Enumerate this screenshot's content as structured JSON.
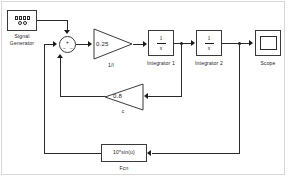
{
  "diagram": {
    "background": "#ffffff",
    "line_color": "#2b2b2b",
    "border_color": "#d8d8d8"
  },
  "blocks": {
    "signal_generator": {
      "label_line1": "Signal",
      "label_line2": "Generator",
      "icon": "signal-generator-icon"
    },
    "sum": {
      "sign_top": "+",
      "sign_left": "−",
      "sign_bottom": "−",
      "icon": "sum-circle-icon"
    },
    "gain_forward": {
      "value": "0.25",
      "label": "1/I"
    },
    "integrator_1": {
      "numerator": "1",
      "denominator": "s",
      "label": "Integrator 1"
    },
    "integrator_2": {
      "numerator": "1",
      "denominator": "s",
      "label": "Integrator 2"
    },
    "scope": {
      "label": "Scope",
      "icon": "scope-screen-icon"
    },
    "gain_feedback": {
      "value": "0.8",
      "label": "c"
    },
    "fcn": {
      "expression": "10*sin(u)",
      "label": "Fcn"
    }
  },
  "signals": [
    {
      "name": "siggen-to-sum",
      "from": "signal_generator",
      "to": "sum"
    },
    {
      "name": "sum-to-gain",
      "from": "sum",
      "to": "gain_forward"
    },
    {
      "name": "gain-to-integrator1",
      "from": "gain_forward",
      "to": "integrator_1"
    },
    {
      "name": "integrator1-to-integrator2",
      "from": "integrator_1",
      "to": "integrator_2"
    },
    {
      "name": "integrator2-to-scope",
      "from": "integrator_2",
      "to": "scope"
    },
    {
      "name": "integrator1-to-gain-feedback",
      "from": "integrator_1",
      "to": "gain_feedback"
    },
    {
      "name": "gain-feedback-to-sum",
      "from": "gain_feedback",
      "to": "sum"
    },
    {
      "name": "integrator2-to-fcn",
      "from": "integrator_2",
      "to": "fcn"
    },
    {
      "name": "fcn-to-sum",
      "from": "fcn",
      "to": "sum"
    }
  ]
}
